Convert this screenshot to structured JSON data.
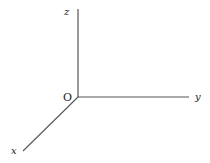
{
  "diagram": {
    "type": "3d-coordinate-axes",
    "origin_label": "O",
    "axes": [
      {
        "name": "x",
        "label": "x",
        "direction": "down-left"
      },
      {
        "name": "y",
        "label": "y",
        "direction": "right"
      },
      {
        "name": "z",
        "label": "z",
        "direction": "up"
      }
    ],
    "line_color": "#444444",
    "text_color": "#222222"
  }
}
